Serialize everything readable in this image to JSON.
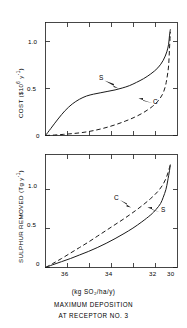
{
  "figure": {
    "caption_unit": "(kg SO₂/ha/y)",
    "caption_line1": "MAXIMUM DEPOSITION",
    "caption_line2": "AT RECEPTOR NO. 3",
    "line_color": "#1a1a1a",
    "background": "#ffffff"
  },
  "panels": {
    "top": {
      "ylabel_main": "COST ($10",
      "ylabel_sup1": "6",
      "ylabel_mid": " y",
      "ylabel_sup2": "-1",
      "ylabel_end": ")",
      "ylabel_full": "COST ($10⁶ y⁻¹)",
      "yticks": [
        "0",
        "0.5",
        "1.0"
      ],
      "curve_s_label": "S",
      "curve_c_label": "C"
    },
    "bottom": {
      "ylabel_main": "SULPHUR REMOVED (Tg y",
      "ylabel_sup": "-1",
      "ylabel_end": ")",
      "ylabel_full": "SULPHUR REMOVED (Tg y⁻¹)",
      "yticks": [
        "0",
        "0.5",
        "1.0"
      ],
      "xticks": [
        "36",
        "34",
        "32",
        "30"
      ],
      "curve_s_label": "S",
      "curve_c_label": "C"
    }
  },
  "chart_data": {
    "type": "line",
    "title": "",
    "xlabel": "MAXIMUM DEPOSITION AT RECEPTOR NO. 3 (kg SO2/ha/y)",
    "xlim": [
      36.9,
      29.5
    ],
    "xticks": [
      36,
      34,
      32,
      30
    ],
    "grid": false,
    "legend": "inline annotations (S, C)",
    "panels": [
      {
        "name": "top",
        "ylabel": "COST ($10^6 y^-1)",
        "ylim": [
          0,
          1.2
        ],
        "yticks": [
          0,
          0.5,
          1.0
        ],
        "series": [
          {
            "name": "S",
            "style": "solid",
            "x": [
              36.9,
              36.6,
              36.2,
              35.8,
              35.4,
              35.0,
              34.6,
              34.2,
              33.8,
              33.4,
              33.0,
              32.6,
              32.2,
              31.8,
              31.4,
              31.0,
              30.6,
              30.3,
              30.1,
              30.0,
              29.95,
              29.9
            ],
            "y": [
              0.0,
              0.075,
              0.175,
              0.265,
              0.335,
              0.385,
              0.42,
              0.44,
              0.455,
              0.47,
              0.485,
              0.505,
              0.53,
              0.565,
              0.605,
              0.655,
              0.72,
              0.8,
              0.89,
              0.97,
              1.06,
              1.13
            ]
          },
          {
            "name": "C",
            "style": "dashed",
            "x": [
              36.9,
              36.4,
              35.9,
              35.4,
              34.9,
              34.4,
              33.9,
              33.4,
              32.9,
              32.4,
              31.9,
              31.4,
              30.9,
              30.6,
              30.35,
              30.2,
              30.1,
              30.0,
              29.95,
              29.9
            ],
            "y": [
              0.0,
              0.005,
              0.012,
              0.02,
              0.03,
              0.045,
              0.065,
              0.09,
              0.12,
              0.155,
              0.195,
              0.245,
              0.31,
              0.365,
              0.435,
              0.51,
              0.6,
              0.74,
              0.92,
              1.1
            ]
          }
        ],
        "annotations": [
          {
            "text": "S",
            "x": 33.4,
            "y": 0.545,
            "points_to": [
              32.8,
              0.49
            ]
          },
          {
            "text": "C",
            "x": 30.6,
            "y": 0.375,
            "points_to": [
              31.2,
              0.345
            ]
          }
        ]
      },
      {
        "name": "bottom",
        "ylabel": "SULPHUR REMOVED (Tg y^-1)",
        "ylim": [
          0,
          1.45
        ],
        "yticks": [
          0,
          0.5,
          1.0
        ],
        "series": [
          {
            "name": "S",
            "style": "solid",
            "x": [
              36.9,
              36.5,
              36.0,
              35.5,
              35.0,
              34.5,
              34.0,
              33.5,
              33.0,
              32.5,
              32.0,
              31.5,
              31.0,
              30.7,
              30.45,
              30.3,
              30.15,
              30.05,
              29.95,
              29.9
            ],
            "y": [
              0.0,
              0.035,
              0.075,
              0.115,
              0.16,
              0.205,
              0.255,
              0.31,
              0.37,
              0.435,
              0.505,
              0.585,
              0.675,
              0.745,
              0.82,
              0.9,
              1.0,
              1.11,
              1.24,
              1.32
            ]
          },
          {
            "name": "C",
            "style": "dashed",
            "x": [
              36.9,
              36.5,
              36.0,
              35.5,
              35.0,
              34.5,
              34.0,
              33.5,
              33.0,
              32.5,
              32.0,
              31.5,
              31.0,
              30.6,
              30.3,
              30.1,
              29.95,
              29.9
            ],
            "y": [
              0.0,
              0.05,
              0.115,
              0.185,
              0.255,
              0.325,
              0.4,
              0.475,
              0.55,
              0.625,
              0.705,
              0.79,
              0.885,
              0.975,
              1.07,
              1.17,
              1.28,
              1.33
            ]
          }
        ],
        "annotations": [
          {
            "text": "C",
            "x": 32.55,
            "y": 0.73,
            "points_to": [
              32.0,
              0.645
            ]
          },
          {
            "text": "S",
            "x": 30.5,
            "y": 0.63,
            "points_to": [
              31.0,
              0.665
            ]
          }
        ]
      }
    ]
  }
}
